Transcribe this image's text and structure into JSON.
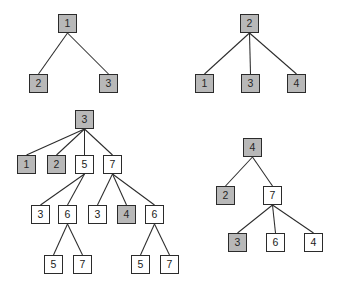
{
  "figure": {
    "colors": {
      "node_fill_marked": "#b8b8b8",
      "node_fill_unmarked": "#ffffff",
      "node_border": "#2b2b2b",
      "edge": "#2b2b2b",
      "background": "#ffffff"
    },
    "legend": {
      "marked_label": "gray",
      "unmarked_label": "white"
    }
  },
  "trees": [
    {
      "id": "tree-top-left",
      "name": "tree-1",
      "root_label": "1",
      "nodes": [
        {
          "id": "t1n0",
          "label": "1",
          "fill": "gray",
          "x": 58,
          "y": 14
        },
        {
          "id": "t1n1",
          "label": "2",
          "fill": "gray",
          "x": 29,
          "y": 74
        },
        {
          "id": "t1n2",
          "label": "3",
          "fill": "gray",
          "x": 99,
          "y": 74
        }
      ],
      "edges": [
        {
          "from": "t1n0",
          "to": "t1n1"
        },
        {
          "from": "t1n0",
          "to": "t1n2"
        }
      ]
    },
    {
      "id": "tree-top-right",
      "name": "tree-2",
      "root_label": "2",
      "nodes": [
        {
          "id": "t2n0",
          "label": "2",
          "fill": "gray",
          "x": 240,
          "y": 14
        },
        {
          "id": "t2n1",
          "label": "1",
          "fill": "gray",
          "x": 195,
          "y": 74
        },
        {
          "id": "t2n2",
          "label": "3",
          "fill": "gray",
          "x": 241,
          "y": 74
        },
        {
          "id": "t2n3",
          "label": "4",
          "fill": "gray",
          "x": 287,
          "y": 74
        }
      ],
      "edges": [
        {
          "from": "t2n0",
          "to": "t2n1"
        },
        {
          "from": "t2n0",
          "to": "t2n2"
        },
        {
          "from": "t2n0",
          "to": "t2n3"
        }
      ]
    },
    {
      "id": "tree-bottom-left",
      "name": "tree-3",
      "root_label": "3",
      "nodes": [
        {
          "id": "t3n0",
          "label": "3",
          "fill": "gray",
          "x": 75,
          "y": 110
        },
        {
          "id": "t3n1",
          "label": "1",
          "fill": "gray",
          "x": 17,
          "y": 155
        },
        {
          "id": "t3n2",
          "label": "2",
          "fill": "gray",
          "x": 47,
          "y": 155
        },
        {
          "id": "t3n3",
          "label": "5",
          "fill": "white",
          "x": 75,
          "y": 155
        },
        {
          "id": "t3n4",
          "label": "7",
          "fill": "white",
          "x": 103,
          "y": 155
        },
        {
          "id": "t3n5",
          "label": "3",
          "fill": "white",
          "x": 31,
          "y": 205
        },
        {
          "id": "t3n6",
          "label": "6",
          "fill": "white",
          "x": 58,
          "y": 205
        },
        {
          "id": "t3n7",
          "label": "3",
          "fill": "white",
          "x": 88,
          "y": 205
        },
        {
          "id": "t3n8",
          "label": "4",
          "fill": "gray",
          "x": 117,
          "y": 205
        },
        {
          "id": "t3n9",
          "label": "6",
          "fill": "white",
          "x": 145,
          "y": 205
        },
        {
          "id": "t3n10",
          "label": "5",
          "fill": "white",
          "x": 44,
          "y": 255
        },
        {
          "id": "t3n11",
          "label": "7",
          "fill": "white",
          "x": 73,
          "y": 255
        },
        {
          "id": "t3n12",
          "label": "5",
          "fill": "white",
          "x": 131,
          "y": 255
        },
        {
          "id": "t3n13",
          "label": "7",
          "fill": "white",
          "x": 160,
          "y": 255
        }
      ],
      "edges": [
        {
          "from": "t3n0",
          "to": "t3n1"
        },
        {
          "from": "t3n0",
          "to": "t3n2"
        },
        {
          "from": "t3n0",
          "to": "t3n3"
        },
        {
          "from": "t3n0",
          "to": "t3n4"
        },
        {
          "from": "t3n3",
          "to": "t3n5"
        },
        {
          "from": "t3n3",
          "to": "t3n6"
        },
        {
          "from": "t3n4",
          "to": "t3n7"
        },
        {
          "from": "t3n4",
          "to": "t3n8"
        },
        {
          "from": "t3n4",
          "to": "t3n9"
        },
        {
          "from": "t3n6",
          "to": "t3n10"
        },
        {
          "from": "t3n6",
          "to": "t3n11"
        },
        {
          "from": "t3n9",
          "to": "t3n12"
        },
        {
          "from": "t3n9",
          "to": "t3n13"
        }
      ]
    },
    {
      "id": "tree-bottom-right",
      "name": "tree-4",
      "root_label": "4",
      "nodes": [
        {
          "id": "t4n0",
          "label": "4",
          "fill": "gray",
          "x": 243,
          "y": 138
        },
        {
          "id": "t4n1",
          "label": "2",
          "fill": "gray",
          "x": 216,
          "y": 186
        },
        {
          "id": "t4n2",
          "label": "7",
          "fill": "white",
          "x": 263,
          "y": 186
        },
        {
          "id": "t4n3",
          "label": "3",
          "fill": "gray",
          "x": 228,
          "y": 233
        },
        {
          "id": "t4n4",
          "label": "6",
          "fill": "white",
          "x": 266,
          "y": 233
        },
        {
          "id": "t4n5",
          "label": "4",
          "fill": "white",
          "x": 304,
          "y": 233
        }
      ],
      "edges": [
        {
          "from": "t4n0",
          "to": "t4n1"
        },
        {
          "from": "t4n0",
          "to": "t4n2"
        },
        {
          "from": "t4n2",
          "to": "t4n3"
        },
        {
          "from": "t4n2",
          "to": "t4n4"
        },
        {
          "from": "t4n2",
          "to": "t4n5"
        }
      ]
    }
  ]
}
